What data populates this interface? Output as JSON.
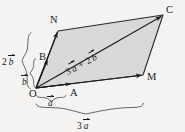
{
  "figure": {
    "type": "vector-parallelogram-diagram",
    "background_color": "#f4f3f1",
    "fill_color": "#d9d9d9",
    "stroke_color": "#1a1a1a",
    "points": {
      "O": {
        "label": "O",
        "x": 36,
        "y": 88
      },
      "A": {
        "label": "A",
        "x": 72,
        "y": 88
      },
      "B": {
        "label": "B",
        "x": 48,
        "y": 59
      },
      "M": {
        "label": "M",
        "x": 143,
        "y": 75
      },
      "N": {
        "label": "N",
        "x": 58,
        "y": 31
      },
      "C": {
        "label": "C",
        "x": 163,
        "y": 15
      }
    },
    "labels": {
      "a": {
        "coef": "",
        "symbol": "a"
      },
      "b": {
        "coef": "",
        "symbol": "b"
      },
      "two_b": {
        "coef": "2",
        "symbol": "b"
      },
      "three_a": {
        "coef": "3",
        "symbol": "a"
      },
      "diagonal": {
        "first_coef": "3",
        "first_symbol": "a",
        "operator": "+",
        "second_coef": "2",
        "second_symbol": "b"
      }
    },
    "braces": {
      "b_brace": "b",
      "two_b_brace": "2 b",
      "a_brace": "a",
      "three_a_brace": "3 a"
    }
  }
}
